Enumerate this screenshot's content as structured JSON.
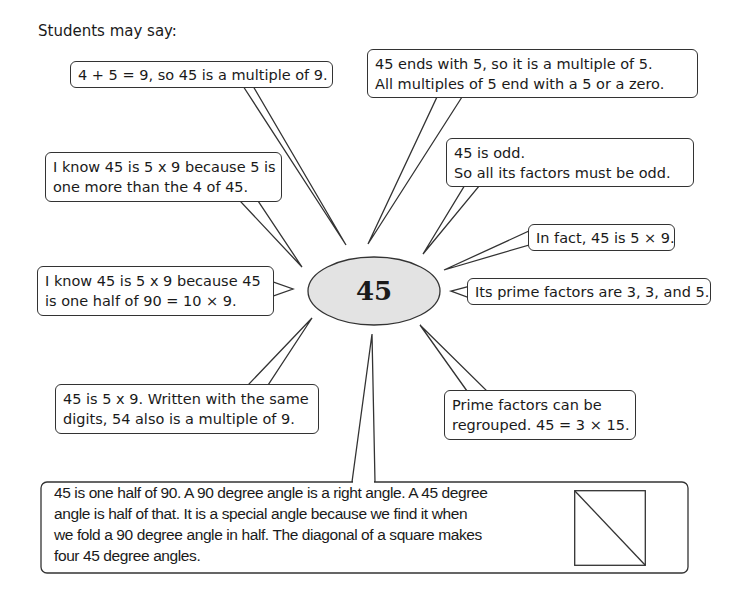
{
  "intro": "Students may say:",
  "center": {
    "label": "45",
    "fill": "#e3e3e3"
  },
  "bubbles": [
    {
      "id": "sum-digits",
      "lines": [
        "4 + 5 = 9, so 45 is a multiple of 9."
      ]
    },
    {
      "id": "ends-with-5",
      "lines": [
        "45 ends with 5, so it is a multiple of 5.",
        "All multiples of 5 end with a 5 or a zero."
      ]
    },
    {
      "id": "five-more",
      "lines": [
        "I know 45 is 5 x 9 because 5 is",
        "one more than the 4 of 45."
      ]
    },
    {
      "id": "is-odd",
      "lines": [
        "45 is odd.",
        "So all its factors must be odd."
      ]
    },
    {
      "id": "in-fact",
      "lines": [
        "In fact, 45 is 5 × 9."
      ]
    },
    {
      "id": "half-of-90",
      "lines": [
        "I know 45 is 5 x 9 because 45",
        "is one half of 90 = 10 × 9."
      ]
    },
    {
      "id": "prime-factors",
      "lines": [
        "Its prime factors are 3, 3, and 5."
      ]
    },
    {
      "id": "digits-54",
      "lines": [
        "45 is 5 x 9. Written with the same",
        "digits, 54 also is a multiple of 9."
      ]
    },
    {
      "id": "regrouped",
      "lines": [
        "Prime factors can be",
        "regrouped.  45 = 3 × 15."
      ]
    }
  ],
  "bottom": {
    "text": "45 is one half of 90. A 90 degree angle is a right angle. A 45 degree angle is half of that. It is a special angle because we find it when we fold a 90 degree angle in half. The diagonal of a square makes four 45 degree angles.",
    "figure": "square-with-diagonal"
  }
}
